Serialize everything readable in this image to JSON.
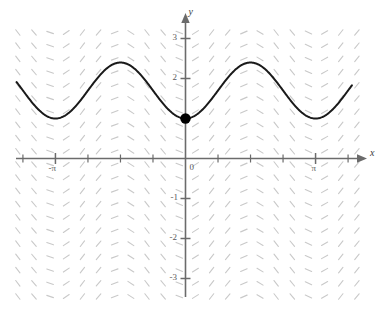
{
  "figure": {
    "kind": "slope-field-with-solution-curve",
    "background_color": "#ffffff",
    "axis_color": "#6b6b6b",
    "slope_field_color": "#c9c9c9",
    "curve_color": "#1a1a1a",
    "point_color": "#000000"
  },
  "axes": {
    "x_axis_label": "x",
    "y_axis_label": "y",
    "origin_label": "0",
    "x_tick_labels": [
      {
        "text": "-π",
        "value": -3.14159
      },
      {
        "text": "π",
        "value": 3.14159
      }
    ],
    "y_tick_labels": [
      {
        "text": "3",
        "value": 3
      },
      {
        "text": "2",
        "value": 2
      },
      {
        "text": "-1",
        "value": -1
      },
      {
        "text": "-2",
        "value": -2
      },
      {
        "text": "-3",
        "value": -3
      }
    ],
    "x_range": [
      -4.2,
      4.3
    ],
    "y_range": [
      -3.5,
      3.4
    ],
    "x_tick_step": 0.7853981634,
    "y_tick_step": 1,
    "grid": false
  },
  "chart_data": {
    "type": "line",
    "title": "",
    "xlabel": "x",
    "ylabel": "y",
    "xlim": [
      -4.2,
      4.3
    ],
    "ylim": [
      -3.5,
      3.4
    ],
    "grid": false,
    "legend": null,
    "annotations": [
      {
        "kind": "point",
        "label": "initial condition",
        "x": 0,
        "y": 1,
        "marker": "filled-circle"
      }
    ],
    "series": [
      {
        "name": "solution curve",
        "expression": "y = 1.7 - 0.7*cos(2x)",
        "color": "#1a1a1a",
        "x": [
          -4.2,
          -4.0,
          -3.8,
          -3.6,
          -3.4,
          -3.2,
          -3.0,
          -2.8,
          -2.6,
          -2.4,
          -2.2,
          -2.0,
          -1.8,
          -1.6,
          -1.4,
          -1.2,
          -1.0,
          -0.8,
          -0.6,
          -0.4,
          -0.2,
          0.0,
          0.2,
          0.4,
          0.6,
          0.8,
          1.0,
          1.2,
          1.4,
          1.6,
          1.8,
          2.0,
          2.2,
          2.4,
          2.6,
          2.8,
          3.0,
          3.2,
          3.4,
          3.6,
          3.8,
          4.0,
          4.2
        ],
        "values": [
          2.06,
          1.7,
          1.39,
          1.15,
          1.03,
          1.0,
          1.1,
          1.29,
          1.54,
          1.81,
          2.07,
          2.16,
          2.4,
          2.39,
          2.26,
          2.02,
          1.99,
          1.7,
          1.4,
          1.15,
          1.03,
          1.0,
          1.03,
          1.15,
          1.4,
          1.7,
          1.99,
          2.2,
          2.36,
          2.4,
          2.3,
          2.09,
          1.82,
          1.54,
          1.29,
          1.1,
          1.0,
          1.03,
          1.17,
          1.39,
          1.66,
          1.93,
          2.17
        ],
        "amplitude": 0.7,
        "midline": 1.7,
        "period": 3.14159,
        "minimum_value": 1.0,
        "maximum_value": 2.4
      }
    ],
    "slope_field": {
      "description": "light gray short dash segments on a regular lattice, slope varies with x and y",
      "color": "#c9c9c9",
      "x_spacing": 0.39,
      "y_spacing": 0.33,
      "segment_length_px": 7
    }
  }
}
